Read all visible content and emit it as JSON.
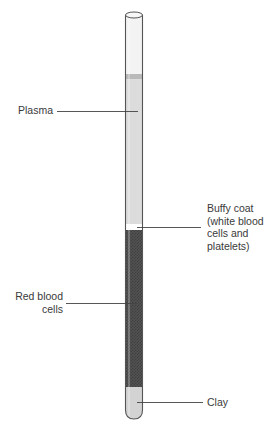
{
  "diagram": {
    "title": "",
    "type": "centrifuged blood sample in capillary tube",
    "labels": {
      "plasma": "Plasma",
      "buffy_coat": "Buffy coat\n(white blood\ncells and\nplatelets)",
      "red_blood_cells": "Red blood\ncells",
      "clay": "Clay"
    },
    "layers": [
      {
        "name": "Plasma",
        "color": "#dcdcdc"
      },
      {
        "name": "Buffy coat",
        "color": "#ffffff"
      },
      {
        "name": "Red blood cells",
        "color": "#4a4a4a"
      },
      {
        "name": "Clay",
        "color": "#d2d2d2"
      }
    ],
    "colors": {
      "tube_outline": "#555555",
      "empty_tube": "#f2f2f2",
      "plasma": "#dcdcdc",
      "meniscus": "#b5b5b5",
      "buffy_coat": "#ffffff",
      "red_blood_cells": "#4b4b4b",
      "clay": "#d3d3d3",
      "leader_line": "#444444"
    }
  }
}
